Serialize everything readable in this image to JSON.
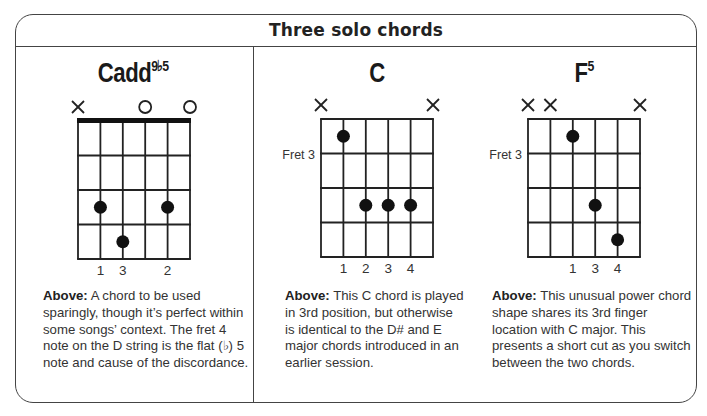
{
  "panel": {
    "title": "Three solo chords"
  },
  "chords": [
    {
      "name": "Cadd",
      "superscript": "9♭5",
      "string_markers": [
        "x",
        "",
        "",
        "o",
        "",
        "o"
      ],
      "fret_label": "",
      "has_nut": true,
      "dots": [
        {
          "string": 2,
          "fret": 3
        },
        {
          "string": 5,
          "fret": 3
        },
        {
          "string": 3,
          "fret": 4
        }
      ],
      "finger_numbers": [
        {
          "string": 2,
          "label": "1"
        },
        {
          "string": 3,
          "label": "3"
        },
        {
          "string": 5,
          "label": "2"
        }
      ],
      "caption_lead": "Above:",
      "caption_text": " A chord to be used sparingly, though it’s perfect within some songs’ context. The fret 4 note on the D string is the flat (♭) 5 note and cause of the discordance."
    },
    {
      "name": "C",
      "superscript": "",
      "string_markers": [
        "x",
        "",
        "",
        "",
        "",
        "x"
      ],
      "fret_label": "Fret 3",
      "has_nut": false,
      "dots": [
        {
          "string": 2,
          "fret": 1
        },
        {
          "string": 3,
          "fret": 3
        },
        {
          "string": 4,
          "fret": 3
        },
        {
          "string": 5,
          "fret": 3
        }
      ],
      "finger_numbers": [
        {
          "string": 2,
          "label": "1"
        },
        {
          "string": 3,
          "label": "2"
        },
        {
          "string": 4,
          "label": "3"
        },
        {
          "string": 5,
          "label": "4"
        }
      ],
      "caption_lead": "Above:",
      "caption_text": " This C chord is played in 3rd position, but otherwise is identical to the D# and E major chords introduced in an earlier session."
    },
    {
      "name": "F",
      "superscript": "5",
      "string_markers": [
        "x",
        "x",
        "",
        "",
        "",
        "x"
      ],
      "fret_label": "Fret 3",
      "has_nut": false,
      "dots": [
        {
          "string": 3,
          "fret": 1
        },
        {
          "string": 4,
          "fret": 3
        },
        {
          "string": 5,
          "fret": 4
        }
      ],
      "finger_numbers": [
        {
          "string": 3,
          "label": "1"
        },
        {
          "string": 4,
          "label": "3"
        },
        {
          "string": 5,
          "label": "4"
        }
      ],
      "caption_lead": "Above:",
      "caption_text": " This unusual power chord shape shares its 3rd finger location with C major. This presents a short cut as you switch between the two chords."
    }
  ]
}
